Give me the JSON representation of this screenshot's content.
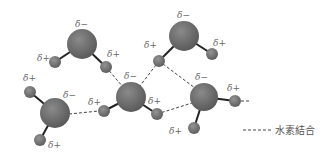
{
  "diagram": {
    "labels": {
      "delta_minus": "δ−",
      "delta_plus": "δ+"
    },
    "legend": {
      "dashed_line_label": "水素結合"
    },
    "colors": {
      "oxygen": "#6e6e6e",
      "hydrogen": "#7a7a7a",
      "bond": "#222222",
      "hbond": "#444444",
      "label": "#666666"
    },
    "molecules": [
      {
        "name": "molecule-a",
        "o": [
          82,
          44
        ],
        "h": [
          [
            55,
            62
          ],
          [
            106,
            67
          ]
        ],
        "labels": [
          [
            "δ−",
            77,
            27
          ],
          [
            "δ+",
            37,
            61
          ],
          [
            "δ+",
            107,
            57
          ]
        ]
      },
      {
        "name": "molecule-b",
        "o": [
          184,
          36
        ],
        "h": [
          [
            159,
            61
          ],
          [
            212,
            54
          ]
        ],
        "labels": [
          [
            "δ−",
            178,
            18
          ],
          [
            "δ+",
            144,
            48
          ],
          [
            "δ+",
            213,
            46
          ]
        ]
      },
      {
        "name": "molecule-c",
        "o": [
          131,
          97
        ],
        "h": [
          [
            104,
            111
          ],
          [
            157,
            114
          ]
        ],
        "labels": [
          [
            "δ−",
            125,
            79
          ],
          [
            "δ+",
            88,
            105
          ],
          [
            "δ+",
            148,
            104
          ]
        ]
      },
      {
        "name": "molecule-d",
        "o": [
          204,
          97
        ],
        "h": [
          [
            235,
            101
          ],
          [
            194,
            128
          ]
        ],
        "labels": [
          [
            "δ−",
            196,
            80
          ],
          [
            "δ+",
            227,
            91
          ],
          [
            "δ+",
            169,
            134
          ]
        ]
      },
      {
        "name": "molecule-e",
        "o": [
          55,
          113
        ],
        "h": [
          [
            30,
            92
          ],
          [
            40,
            140
          ]
        ],
        "labels": [
          [
            "δ−",
            63,
            98
          ],
          [
            "δ+",
            23,
            81
          ],
          [
            "δ+",
            48,
            148
          ]
        ]
      }
    ]
  }
}
